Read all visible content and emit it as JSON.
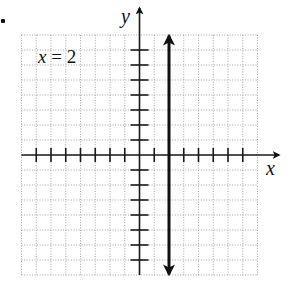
{
  "figure": {
    "list_marker": ".",
    "equation": {
      "variable": "x",
      "operator_value": " = 2",
      "full_text": "x = 2"
    },
    "axes": {
      "x_label": "x",
      "y_label": "y"
    },
    "grid": {
      "x_min": -8,
      "x_max": 8,
      "y_min": -8,
      "y_max": 8,
      "step": 1,
      "style": "dotted"
    },
    "ticks": {
      "x": [
        -7,
        -6,
        -5,
        -4,
        -3,
        -2,
        -1,
        1,
        2,
        3,
        4,
        5,
        6,
        7
      ],
      "y": [
        -7,
        -6,
        -5,
        -4,
        -3,
        -2,
        -1,
        1,
        2,
        3,
        4,
        5,
        6,
        7
      ]
    },
    "graph": {
      "type": "vertical-line",
      "x_value": 2,
      "arrows": "both-ends",
      "color": "#111111"
    }
  },
  "chart_data": {
    "type": "line",
    "title": "x = 2",
    "xlabel": "x",
    "ylabel": "y",
    "xlim": [
      -8,
      8
    ],
    "ylim": [
      -8,
      8
    ],
    "grid": true,
    "series": [
      {
        "name": "x = 2",
        "x": [
          2,
          2
        ],
        "y": [
          -8,
          8
        ]
      }
    ],
    "annotations": [
      "x = 2"
    ]
  }
}
